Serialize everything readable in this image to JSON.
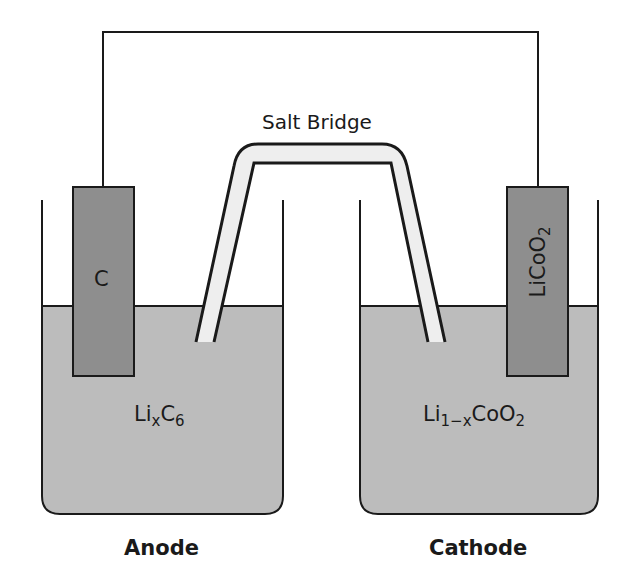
{
  "diagram": {
    "colors": {
      "solution": "#bcbcbc",
      "electrode": "#8e8e8e",
      "salt_bridge_fill": "#eeeeee",
      "line": "#1a1a1a",
      "background": "#ffffff"
    },
    "salt_bridge": {
      "label": "Salt Bridge"
    },
    "anode": {
      "label": "Anode",
      "electrode_label": "C",
      "solution_formula": {
        "base": "Li",
        "sub1": "x",
        "mid": "C",
        "sub2": "6"
      }
    },
    "cathode": {
      "label": "Cathode",
      "electrode_formula": {
        "base": "LiCoO",
        "sub": "2"
      },
      "solution_formula": {
        "base": "Li",
        "sub1": "1−x",
        "mid": "CoO",
        "sub2": "2"
      }
    }
  }
}
